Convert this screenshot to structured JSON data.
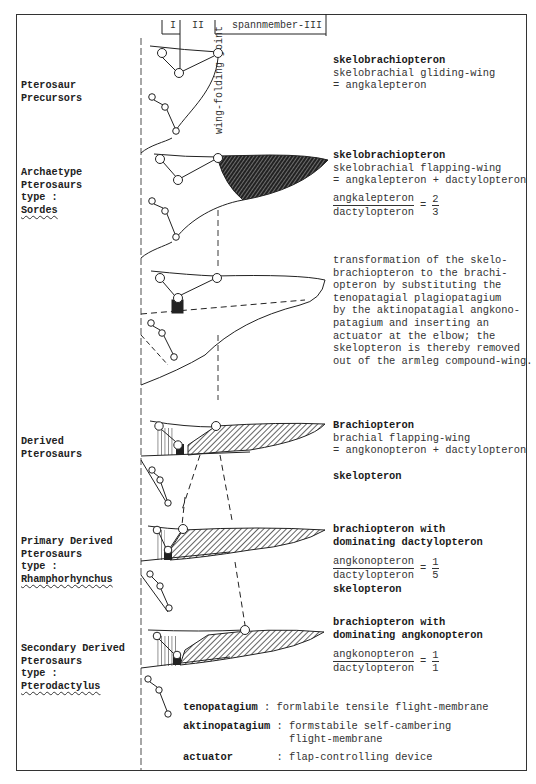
{
  "header": {
    "segment_1": "I",
    "segment_2": "II",
    "segment_3": "spannmember-III",
    "vertical_label": "wing-folding joint"
  },
  "rows": [
    {
      "group_label": [
        "Pterosaur",
        "Precursors"
      ],
      "type_name": null,
      "title": "skelobrachiopteron",
      "lines": [
        "skelobrachial gliding-wing",
        "= angkalepteron"
      ]
    },
    {
      "group_label": [
        "Archaetype",
        "Pterosaurs",
        "type :"
      ],
      "type_name": "Sordes",
      "title": "skelobrachiopteron",
      "lines": [
        "skelobrachial flapping-wing",
        "= angkalepteron + dactylopteron"
      ],
      "ratio": {
        "numerator": "angkalepteron",
        "denominator": "dactylopteron",
        "value_num": "2",
        "value_den": "3"
      }
    },
    {
      "group_label": [],
      "type_name": null,
      "title": null,
      "lines": [
        "transformation of the skelo-",
        "brachiopteron to the brachi-",
        "opteron by substituting the",
        "tenopatagial plagiopatagium",
        "by the aktinopatagial angkono-",
        "patagium and inserting an",
        "actuator at the elbow; the",
        "skelopteron is thereby removed",
        "out of the armleg compound-wing."
      ]
    },
    {
      "group_label": [
        "Derived",
        "Pterosaurs"
      ],
      "type_name": null,
      "title": "Brachiopteron",
      "lines": [
        "brachial flapping-wing",
        "= angkonopteron + dactylopteron"
      ],
      "extra_bold": "skelopteron"
    },
    {
      "group_label": [
        "Primary Derived",
        "Pterosaurs",
        "type :"
      ],
      "type_name": "Rhamphorhynchus",
      "title_lines": [
        "brachiopteron with",
        "dominating dactylopteron"
      ],
      "ratio": {
        "numerator": "angkonopteron",
        "denominator": "dactylopteron",
        "value_num": "1",
        "value_den": "5"
      },
      "extra_bold": "skelopteron"
    },
    {
      "group_label": [
        "Secondary Derived",
        "Pterosaurs",
        "type :"
      ],
      "type_name": "Pterodactylus",
      "title_lines": [
        "brachiopteron with",
        "dominating angkonopteron"
      ],
      "ratio": {
        "numerator": "angkonopteron",
        "denominator": "dactylopteron",
        "value_num": "1",
        "value_den": "1"
      }
    }
  ],
  "legend": [
    {
      "term": "tenopatagium",
      "sep": ":",
      "definition": [
        "formlabile tensile flight-membrane"
      ]
    },
    {
      "term": "aktinopatagium",
      "sep": ":",
      "definition": [
        "formstabile self-cambering",
        "flight-membrane"
      ]
    },
    {
      "term": "actuator",
      "sep": ":",
      "definition": [
        "flap-controlling device"
      ]
    }
  ],
  "colors": {
    "ink": "#222222",
    "paper": "#ffffff"
  }
}
